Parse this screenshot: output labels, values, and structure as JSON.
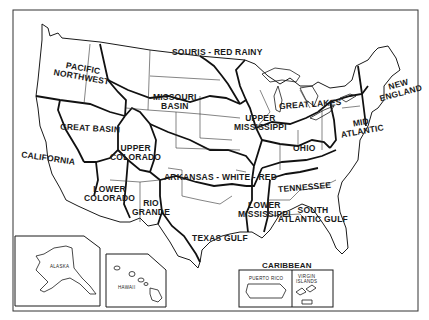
{
  "map": {
    "title": "Water Resource Regions of the United States",
    "colors": {
      "background": "#ffffff",
      "ink": "#1a1a1a"
    },
    "regions": [
      {
        "id": "new-england",
        "label_lines": [
          "NEW",
          "ENGLAND"
        ]
      },
      {
        "id": "mid-atlantic",
        "label_lines": [
          "MID",
          "ATLANTIC"
        ]
      },
      {
        "id": "south-atlantic-gulf",
        "label_lines": [
          "SOUTH",
          "ATLANTIC GULF"
        ]
      },
      {
        "id": "great-lakes",
        "label_lines": [
          "GREAT LAKES"
        ]
      },
      {
        "id": "ohio",
        "label_lines": [
          "OHIO"
        ]
      },
      {
        "id": "tennessee",
        "label_lines": [
          "TENNESSEE"
        ]
      },
      {
        "id": "upper-mississippi",
        "label_lines": [
          "UPPER",
          "MISSISSIPPI"
        ]
      },
      {
        "id": "lower-mississippi",
        "label_lines": [
          "LOWER",
          "MISSISSIPPI"
        ]
      },
      {
        "id": "souris-red-rainy",
        "label_lines": [
          "SOURIS - RED RAINY"
        ]
      },
      {
        "id": "missouri-basin",
        "label_lines": [
          "MISSOURI",
          "BASIN"
        ]
      },
      {
        "id": "arkansas-white-red",
        "label_lines": [
          "ARKANSAS - WHITE - RED"
        ]
      },
      {
        "id": "texas-gulf",
        "label_lines": [
          "TEXAS GULF"
        ]
      },
      {
        "id": "rio-grande",
        "label_lines": [
          "RIO",
          "GRANDE"
        ]
      },
      {
        "id": "upper-colorado",
        "label_lines": [
          "UPPER",
          "COLORADO"
        ]
      },
      {
        "id": "lower-colorado",
        "label_lines": [
          "LOWER",
          "COLORADO"
        ]
      },
      {
        "id": "great-basin",
        "label_lines": [
          "GREAT BASIN"
        ]
      },
      {
        "id": "pacific-northwest",
        "label_lines": [
          "PACIFIC",
          "NORTHWEST"
        ]
      },
      {
        "id": "california",
        "label_lines": [
          "CALIFORNIA"
        ]
      }
    ],
    "insets": {
      "alaska": {
        "label": "ALASKA"
      },
      "hawaii": {
        "label": "HAWAII"
      },
      "caribbean": {
        "title": "CARIBBEAN",
        "puerto_rico": "PUERTO RICO",
        "virgin_islands_lines": [
          "VIRGIN",
          "ISLANDS"
        ]
      }
    }
  }
}
